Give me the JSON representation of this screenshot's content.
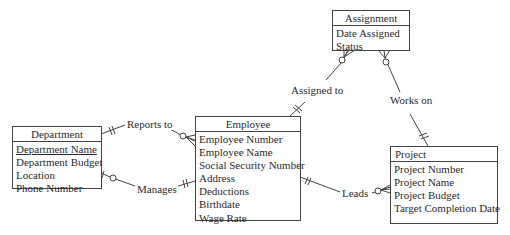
{
  "diagram": {
    "type": "entity-relationship",
    "line_color": "#444444",
    "entities": {
      "department": {
        "name": "Department",
        "attributes": [
          "Department Name",
          "Department Budget",
          "Location",
          "Phone Number"
        ],
        "primary_key": "Department Name"
      },
      "employee": {
        "name": "Employee",
        "attributes": [
          "Employee Number",
          "Employee Name",
          "Social Security Number",
          "Address",
          "Deductions",
          "Birthdate",
          "Wage Rate"
        ]
      },
      "assignment": {
        "name": "Assignment",
        "attributes": [
          "Date Assigned",
          "Status"
        ]
      },
      "project": {
        "name": "Project",
        "attributes": [
          "Project Number",
          "Project Name",
          "Project Budget",
          "Target Completion Date"
        ]
      }
    },
    "relationships": {
      "reports_to": {
        "label": "Reports to",
        "from": "Department",
        "from_card": "one-and-only-one",
        "to": "Employee",
        "to_card": "zero-or-many"
      },
      "manages": {
        "label": "Manages",
        "from": "Department",
        "from_card": "zero-or-one",
        "to": "Employee",
        "to_card": "one-and-only-one"
      },
      "assigned_to": {
        "label": "Assigned to",
        "from": "Employee",
        "from_card": "one-and-only-one",
        "to": "Assignment",
        "to_card": "zero-or-many"
      },
      "works_on": {
        "label": "Works on",
        "from": "Project",
        "from_card": "one-and-only-one",
        "to": "Assignment",
        "to_card": "zero-or-many"
      },
      "leads": {
        "label": "Leads",
        "from": "Employee",
        "from_card": "one-and-only-one",
        "to": "Project",
        "to_card": "zero-or-many"
      }
    }
  }
}
